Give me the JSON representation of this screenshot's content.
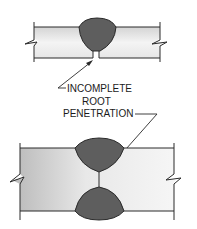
{
  "diagram": {
    "label": {
      "line1": "INCOMPLETE",
      "line2": "ROOT",
      "line3": "PENETRATION"
    },
    "figures": [
      {
        "name": "single-v-weld",
        "description": "Single weld bead from top with unfused root gap"
      },
      {
        "name": "double-v-weld",
        "description": "Weld beads from top and bottom with unfused gap between them"
      }
    ],
    "colors": {
      "plate_fill_light": "#f2f2f2",
      "plate_fill_dark": "#b8b8b8",
      "weld_fill": "#5e5e5e",
      "line": "#2a2a2a",
      "background": "#ffffff"
    }
  }
}
